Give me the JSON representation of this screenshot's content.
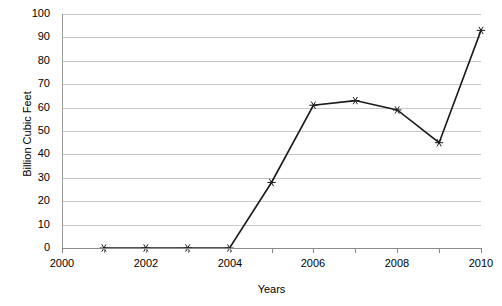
{
  "chart_data": {
    "type": "line",
    "title": "",
    "xlabel": "Years",
    "ylabel": "Billion Cubic Feet",
    "x": [
      2001,
      2002,
      2003,
      2004,
      2005,
      2006,
      2007,
      2008,
      2009,
      2010
    ],
    "values": [
      0,
      0,
      0,
      0,
      28,
      61,
      63,
      59,
      45,
      93
    ],
    "series": [
      {
        "name": "",
        "values": [
          0,
          0,
          0,
          0,
          28,
          61,
          63,
          59,
          45,
          93
        ]
      }
    ],
    "xlim": [
      2000,
      2010
    ],
    "ylim": [
      0,
      100
    ],
    "ytick_labels": [
      "0",
      "10",
      "20",
      "30",
      "40",
      "50",
      "60",
      "70",
      "80",
      "90",
      "100"
    ],
    "ytick_values": [
      0,
      10,
      20,
      30,
      40,
      50,
      60,
      70,
      80,
      90,
      100
    ],
    "xtick_values": [
      2000,
      2001,
      2002,
      2003,
      2004,
      2005,
      2006,
      2007,
      2008,
      2009,
      2010
    ],
    "xtick_labels": [
      "2000",
      "",
      "2002",
      "",
      "2004",
      "",
      "2006",
      "",
      "2008",
      "",
      "2010"
    ],
    "grid": "horizontal",
    "legend": "none",
    "marker": "asterisk-marker",
    "line_color": "#1a1a1a",
    "grid_color": "#c8c8c8",
    "axis_color": "#8a8a8a"
  }
}
